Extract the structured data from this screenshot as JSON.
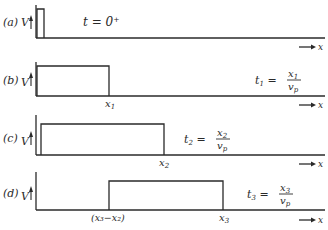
{
  "diagram": {
    "x_axis_label": "x",
    "v_label": "V",
    "panels": [
      {
        "tag": "(a)",
        "time_eq": "t = 0⁺",
        "x_marks": []
      },
      {
        "tag": "(b)",
        "t_sym": "t",
        "t_sub": "1",
        "num": "x",
        "num_sub": "1",
        "den": "v",
        "den_sub": "p",
        "x_marks": [
          {
            "label": "x",
            "sub": "1"
          }
        ]
      },
      {
        "tag": "(c)",
        "t_sym": "t",
        "t_sub": "2",
        "num": "x",
        "num_sub": "2",
        "den": "v",
        "den_sub": "p",
        "x_marks": [
          {
            "label": "x",
            "sub": "2"
          }
        ]
      },
      {
        "tag": "(d)",
        "t_sym": "t",
        "t_sub": "3",
        "num": "x",
        "num_sub": "3",
        "den": "v",
        "den_sub": "p",
        "x_marks": [
          {
            "label": "(x₃−x₂)"
          },
          {
            "label": "x",
            "sub": "3"
          }
        ]
      }
    ],
    "line_color": "#2a2a2a"
  }
}
